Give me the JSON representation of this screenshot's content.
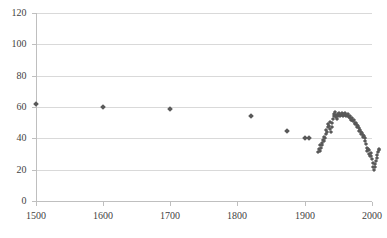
{
  "chart_data": {
    "type": "scatter",
    "title": "",
    "xlabel": "",
    "ylabel": "",
    "xlim": [
      1500,
      2000
    ],
    "ylim": [
      0,
      120
    ],
    "grid": true,
    "legend": false,
    "marker": "diamond",
    "marker_color": "#595959",
    "y_ticks": [
      0,
      20,
      40,
      60,
      80,
      100,
      120
    ],
    "y_tick_labels": [
      "0",
      "20",
      "40",
      "60",
      "80",
      "100",
      "120"
    ],
    "x_ticks": [
      1500,
      1600,
      1700,
      1800,
      1900,
      2000
    ],
    "x_tick_labels": [
      "1500",
      "1600",
      "1700",
      "1800",
      "1900",
      "2000"
    ],
    "series": [
      {
        "name": "series-1",
        "points": [
          [
            1500,
            62.0
          ],
          [
            1600,
            60.2
          ],
          [
            1700,
            59.0
          ],
          [
            1820,
            54.5
          ],
          [
            1873,
            44.5
          ],
          [
            1900,
            40.0
          ],
          [
            1906,
            40.0
          ],
          [
            1920,
            31.0
          ],
          [
            1921,
            33.0
          ],
          [
            1922,
            32.0
          ],
          [
            1923,
            35.5
          ],
          [
            1924,
            34.0
          ],
          [
            1925,
            37.0
          ],
          [
            1926,
            36.0
          ],
          [
            1927,
            39.0
          ],
          [
            1928,
            38.0
          ],
          [
            1929,
            41.0
          ],
          [
            1930,
            40.0
          ],
          [
            1931,
            43.0
          ],
          [
            1932,
            45.5
          ],
          [
            1933,
            44.0
          ],
          [
            1934,
            47.0
          ],
          [
            1935,
            49.0
          ],
          [
            1936,
            48.0
          ],
          [
            1937,
            50.5
          ],
          [
            1938,
            46.0
          ],
          [
            1939,
            44.0
          ],
          [
            1940,
            47.5
          ],
          [
            1941,
            50.0
          ],
          [
            1942,
            52.5
          ],
          [
            1943,
            54.0
          ],
          [
            1944,
            55.5
          ],
          [
            1945,
            56.5
          ],
          [
            1946,
            55.0
          ],
          [
            1947,
            53.5
          ],
          [
            1948,
            52.5
          ],
          [
            1949,
            54.0
          ],
          [
            1950,
            55.5
          ],
          [
            1951,
            56.0
          ],
          [
            1952,
            55.0
          ],
          [
            1953,
            54.0
          ],
          [
            1954,
            55.0
          ],
          [
            1955,
            56.0
          ],
          [
            1956,
            55.5
          ],
          [
            1957,
            54.5
          ],
          [
            1958,
            55.0
          ],
          [
            1959,
            55.5
          ],
          [
            1960,
            56.0
          ],
          [
            1961,
            55.0
          ],
          [
            1962,
            54.5
          ],
          [
            1963,
            55.0
          ],
          [
            1964,
            55.5
          ],
          [
            1965,
            54.5
          ],
          [
            1966,
            53.5
          ],
          [
            1967,
            54.0
          ],
          [
            1968,
            53.0
          ],
          [
            1969,
            52.0
          ],
          [
            1970,
            53.0
          ],
          [
            1971,
            52.0
          ],
          [
            1972,
            51.0
          ],
          [
            1973,
            51.5
          ],
          [
            1974,
            50.0
          ],
          [
            1975,
            49.0
          ],
          [
            1976,
            50.0
          ],
          [
            1977,
            48.5
          ],
          [
            1978,
            47.5
          ],
          [
            1979,
            48.0
          ],
          [
            1980,
            46.5
          ],
          [
            1981,
            45.0
          ],
          [
            1982,
            45.5
          ],
          [
            1983,
            44.0
          ],
          [
            1984,
            43.0
          ],
          [
            1985,
            43.5
          ],
          [
            1986,
            42.0
          ],
          [
            1987,
            41.0
          ],
          [
            1988,
            41.5
          ],
          [
            1989,
            40.0
          ],
          [
            1990,
            38.5
          ],
          [
            1991,
            36.5
          ],
          [
            1992,
            34.0
          ],
          [
            1993,
            32.0
          ],
          [
            1994,
            33.5
          ],
          [
            1995,
            32.5
          ],
          [
            1996,
            30.0
          ],
          [
            1997,
            28.5
          ],
          [
            1998,
            30.5
          ],
          [
            1999,
            29.0
          ],
          [
            2000,
            27.0
          ],
          [
            2001,
            24.5
          ],
          [
            2002,
            22.0
          ],
          [
            2003,
            20.0
          ],
          [
            2004,
            21.5
          ],
          [
            2005,
            23.5
          ],
          [
            2006,
            25.5
          ],
          [
            2007,
            27.5
          ],
          [
            2008,
            29.5
          ],
          [
            2009,
            31.0
          ],
          [
            2010,
            32.5
          ],
          [
            2011,
            33.0
          ]
        ]
      }
    ]
  }
}
